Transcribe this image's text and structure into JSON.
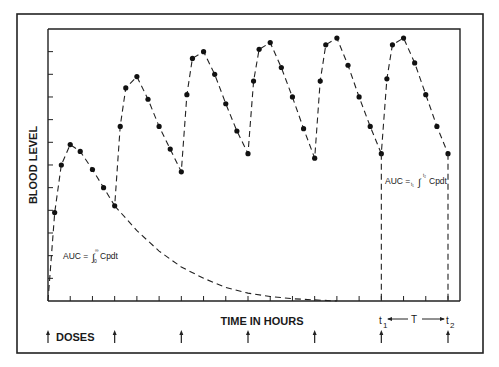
{
  "chart_data": {
    "type": "line",
    "title": "",
    "xlabel": "TIME IN HOURS",
    "ylabel": "BLOOD LEVEL",
    "xlim": [
      0,
      36
    ],
    "ylim": [
      0,
      12
    ],
    "grid": false,
    "x_ticks_every": 2,
    "y_ticks_every": 1,
    "tick_labels_shown": false,
    "doses_label": "DOSES",
    "dose_times": [
      0,
      6,
      12,
      18,
      24,
      30,
      36
    ],
    "series": [
      {
        "name": "Multiple dosing blood level",
        "style": "dashed-with-markers",
        "points": [
          [
            0,
            0.0
          ],
          [
            0.6,
            3.9
          ],
          [
            1.2,
            6.0
          ],
          [
            2,
            6.9
          ],
          [
            2.9,
            6.6
          ],
          [
            4,
            5.8
          ],
          [
            5,
            5.0
          ],
          [
            6,
            4.2
          ],
          [
            6.5,
            7.7
          ],
          [
            7,
            9.4
          ],
          [
            8,
            9.9
          ],
          [
            9,
            8.9
          ],
          [
            10,
            7.7
          ],
          [
            11,
            6.7
          ],
          [
            12,
            5.7
          ],
          [
            12.5,
            9.1
          ],
          [
            13,
            10.7
          ],
          [
            14,
            11.0
          ],
          [
            15,
            10.0
          ],
          [
            16,
            8.7
          ],
          [
            17,
            7.5
          ],
          [
            18,
            6.5
          ],
          [
            18.5,
            9.7
          ],
          [
            19,
            11.1
          ],
          [
            20,
            11.4
          ],
          [
            21,
            10.3
          ],
          [
            22,
            9.0
          ],
          [
            23,
            7.6
          ],
          [
            24,
            6.3
          ],
          [
            24.5,
            9.7
          ],
          [
            25,
            11.3
          ],
          [
            26,
            11.6
          ],
          [
            27,
            10.4
          ],
          [
            28,
            9.0
          ],
          [
            29,
            7.7
          ],
          [
            30,
            6.5
          ],
          [
            30.5,
            9.8
          ],
          [
            31,
            11.3
          ],
          [
            32,
            11.6
          ],
          [
            33,
            10.5
          ],
          [
            34,
            9.1
          ],
          [
            35,
            7.7
          ],
          [
            36,
            6.5
          ]
        ]
      },
      {
        "name": "Single dose elimination curve",
        "style": "dashed",
        "points": [
          [
            0,
            0.0
          ],
          [
            0.6,
            3.9
          ],
          [
            1.2,
            6.0
          ],
          [
            2,
            6.9
          ],
          [
            2.9,
            6.6
          ],
          [
            4,
            5.8
          ],
          [
            5,
            5.0
          ],
          [
            6,
            4.2
          ],
          [
            8,
            3.1
          ],
          [
            10,
            2.2
          ],
          [
            12,
            1.5
          ],
          [
            14,
            1.0
          ],
          [
            16,
            0.6
          ],
          [
            18,
            0.35
          ],
          [
            20,
            0.2
          ],
          [
            22,
            0.1
          ],
          [
            24,
            0.05
          ],
          [
            26,
            0.0
          ]
        ]
      }
    ],
    "annotations": [
      {
        "text": "AUC = ∫₀^∞ Cpdt",
        "main": "AUC = ",
        "integral": "∫",
        "lower": "0",
        "upper": "∞",
        "tail": " Cpdt",
        "x": 2,
        "y": 2.7
      },
      {
        "text": "AUC = t₁∫^t₂ Cpdt",
        "main": "AUC = ",
        "integral": "∫",
        "lower": "t₁",
        "upper": "t₂",
        "tail": " Cpdt",
        "x": 30,
        "y": 5.1
      }
    ],
    "interval_marker": {
      "start_label": "t",
      "start_sub": "1",
      "end_label": "t",
      "end_sub": "2",
      "span_label": "T",
      "start_x": 30,
      "end_x": 36
    }
  }
}
